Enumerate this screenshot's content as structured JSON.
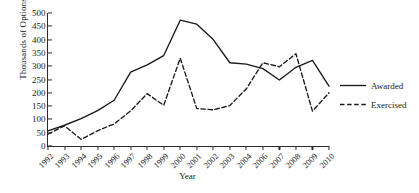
{
  "chart_data": {
    "type": "line",
    "title": "",
    "xlabel": "Year",
    "ylabel": "Thousands of Options",
    "categories": [
      "1992",
      "1993",
      "1994",
      "1995",
      "1996",
      "1997",
      "1998",
      "1999",
      "2000",
      "2001",
      "2002",
      "2003",
      "2004",
      "2006",
      "2007",
      "2008",
      "2009",
      "2010"
    ],
    "tick_labels": [
      "1992",
      "1993",
      "1994",
      "1995",
      "1996",
      "1997",
      "1998",
      "1999",
      "2000",
      "2001",
      "2002",
      "2003",
      "2004",
      "2006",
      "2007",
      "2008",
      "2009",
      "2010"
    ],
    "ylim": [
      0,
      500
    ],
    "yticks": [
      0,
      50,
      100,
      150,
      200,
      250,
      300,
      350,
      400,
      450,
      500
    ],
    "grid": false,
    "legend_position": "right",
    "series": [
      {
        "name": "Awarded",
        "style": "solid",
        "color": "#1a1a1a",
        "values": [
          57,
          78,
          103,
          133,
          172,
          278,
          305,
          340,
          473,
          458,
          400,
          313,
          308,
          291,
          248,
          296,
          322,
          225
        ]
      },
      {
        "name": "Exercised",
        "style": "dashed",
        "color": "#1a1a1a",
        "values": [
          45,
          76,
          25,
          57,
          83,
          132,
          197,
          153,
          330,
          141,
          136,
          152,
          215,
          313,
          298,
          347,
          131,
          200
        ]
      }
    ]
  },
  "axis": {
    "y_title": "Thousands of Options",
    "x_title": "Year"
  },
  "legend": {
    "items": [
      {
        "label": "Awarded"
      },
      {
        "label": "Exercised"
      }
    ]
  }
}
